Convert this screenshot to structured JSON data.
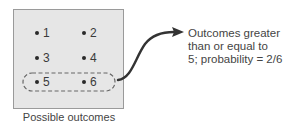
{
  "diagram": {
    "outcomes": [
      {
        "label": "1"
      },
      {
        "label": "2"
      },
      {
        "label": "3"
      },
      {
        "label": "4"
      },
      {
        "label": "5"
      },
      {
        "label": "6"
      }
    ],
    "highlighted_outcomes": [
      "5",
      "6"
    ],
    "caption": "Possible outcomes",
    "annotation": {
      "line1": "Outcomes greater",
      "line2": "than or equal to",
      "line3": "5;  probability = 2/6"
    },
    "colors": {
      "box_fill": "#e6e6e6",
      "box_border": "#9a9a9a",
      "text": "#3a3a3a",
      "arrow": "#333333",
      "dashed_outline": "#666666"
    }
  }
}
